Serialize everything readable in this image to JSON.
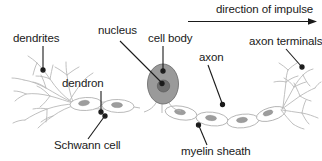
{
  "diagram": {
    "background_color": "#ffffff",
    "text_color": "#1a1a1a",
    "soma_fill": "#9a9a9a",
    "nucleus_fill": "#6e6e6e",
    "outline_color": "#b3b3b3",
    "leader_color": "#1a1a1a",
    "labels": {
      "dendrites": "dendrites",
      "nucleus": "nucleus",
      "cell_body": "cell body",
      "axon_terminals": "axon terminals",
      "axon": "axon",
      "dendron": "dendron",
      "direction_of_impulse": "direction of impulse",
      "schwann_cell": "Schwann cell",
      "myelin_sheath": "myelin sheath"
    }
  }
}
